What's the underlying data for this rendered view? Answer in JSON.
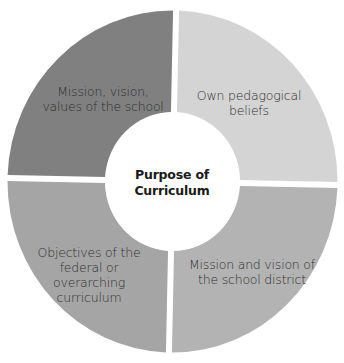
{
  "diagram": {
    "type": "donut-quadrant",
    "center": {
      "label": "Purpose of Curriculum",
      "line1": "Purpose of",
      "line2": "Curriculum"
    },
    "segments": [
      {
        "position": "top-left",
        "label": "Mission, vision, values of the school",
        "lines": [
          "Mission, vision,",
          "values of the school"
        ],
        "color": "#808080"
      },
      {
        "position": "top-right",
        "label": "Own pedagogical beliefs",
        "lines": [
          "Own pedagogical",
          "beliefs"
        ],
        "color": "#d4d4d4"
      },
      {
        "position": "bottom-right",
        "label": "Mission and vision of the school district",
        "lines": [
          "Mission and vision of",
          "the school district"
        ],
        "color": "#b3b3b3"
      },
      {
        "position": "bottom-left",
        "label": "Objectives of the federal or overarching curriculum",
        "lines": [
          "Objectives of the",
          "federal or",
          "overarching",
          "curriculum"
        ],
        "color": "#a5a5a5"
      }
    ],
    "gap_color": "#ffffff"
  }
}
